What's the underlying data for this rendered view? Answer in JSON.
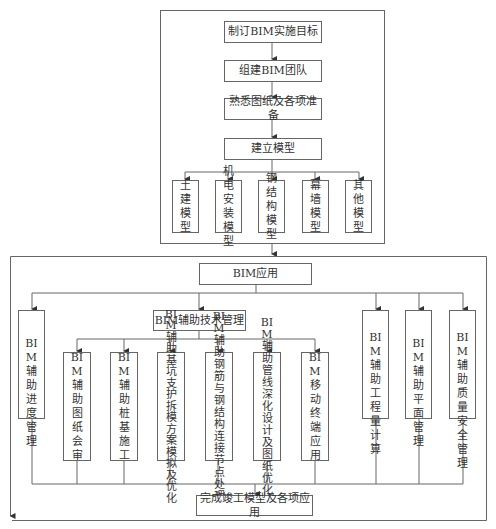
{
  "top_section": {
    "steps": [
      "制订BIM实施目标",
      "组建BIM团队",
      "熟悉图纸及各项准备",
      "建立模型"
    ],
    "models": [
      "土建\n模型",
      "机电\n安装\n模型",
      "钢结\n构模\n型",
      "幕墙\n模型",
      "其他\n模型"
    ]
  },
  "bottom_section": {
    "bim_application": "BIM应用",
    "progress_mgmt": "BIM\n辅助\n进度\n管理",
    "tech_mgmt": "BIM辅助技术管理",
    "tech_items": [
      "BIM\n辅助\n图纸\n会审",
      "BIM\n辅助\n桩基\n施工",
      "BIM\n辅助\n基坑\n支护\n拆模\n方案\n模拟\n及优\n化",
      "BIM\n辅助\n钢筋\n与钢\n结构\n连接\n节点\n处理",
      "BIM\n辅助\n管线\n深化\n设计\n及图\n纸优\n化",
      "BIM\n移动\n终端\n应用"
    ],
    "right_items": [
      "BIM\n辅助\n工程\n量计\n算",
      "BIM\n辅助\n平面\n管理",
      "BIM\n辅助\n质量\n安全\n管理"
    ],
    "final": "完成竣工模型及各项应用"
  }
}
